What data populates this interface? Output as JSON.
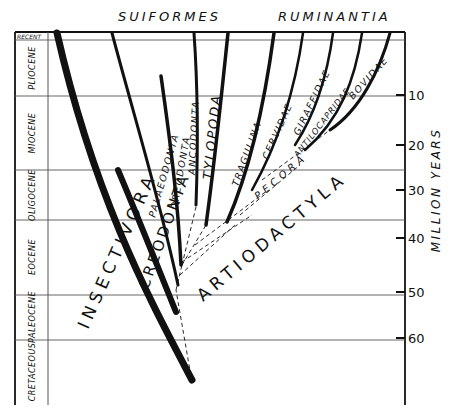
{
  "header": {
    "left_group": "SUIFORMES",
    "right_group": "RUMINANTIA"
  },
  "periods": [
    {
      "label": "RECENT",
      "y_top": 32,
      "y_bottom": 40
    },
    {
      "label": "PLIOCENE",
      "y_top": 40,
      "y_bottom": 96
    },
    {
      "label": "MIOCENE",
      "y_top": 96,
      "y_bottom": 170
    },
    {
      "label": "OLIGOCENE",
      "y_top": 170,
      "y_bottom": 220
    },
    {
      "label": "EOCENE",
      "y_top": 220,
      "y_bottom": 295
    },
    {
      "label": "PALEOCENE",
      "y_top": 295,
      "y_bottom": 340
    },
    {
      "label": "CRETACEOUS",
      "y_top": 340,
      "y_bottom": 405
    }
  ],
  "axis": {
    "title": "MILLION YEARS",
    "ticks": [
      "10",
      "20",
      "30",
      "40",
      "50",
      "60"
    ]
  },
  "taxa": {
    "insectivora": "INSECTIVORA",
    "creodonta": "CREODONTA",
    "palaeodonta": "PALAEODONTA",
    "oreodonta": "OREODONTA",
    "ancodonta": "ANCODONTA",
    "tylopoda": "TYLOPODA",
    "tragulina": "TRAGULINA",
    "cervidae": "CERVIDAE",
    "giraffidae": "GIRAFFIDAE",
    "antilocapridae": "ANTILOCAPRIDAE",
    "bovidae": "BOVIDAE",
    "pecora": "PECORA",
    "artiodactyla": "ARTIODACTYLA"
  },
  "colors": {
    "ink": "#111111",
    "paper": "#ffffff",
    "grid": "#555555"
  }
}
